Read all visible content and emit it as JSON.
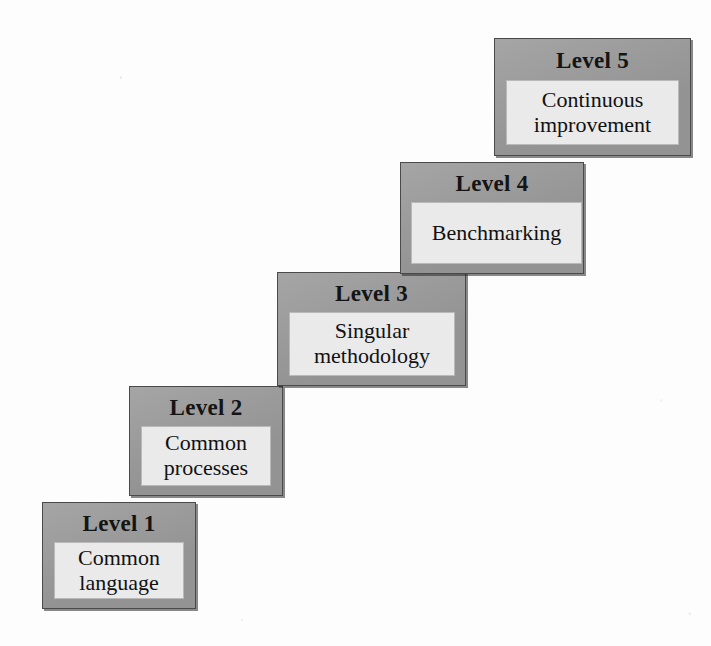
{
  "diagram": {
    "type": "staircase-maturity-model",
    "background_color": "#fdfdfd",
    "step_fill_color": "#9b9b9b",
    "step_inner_color": "#eaeaea",
    "step_border_color": "#4a4a4a",
    "text_color": "#111111",
    "steps": [
      {
        "header": "Level 1",
        "body": "Common\nlanguage"
      },
      {
        "header": "Level 2",
        "body": "Common\nprocesses"
      },
      {
        "header": "Level 3",
        "body": "Singular\nmethodology"
      },
      {
        "header": "Level 4",
        "body": "Benchmarking"
      },
      {
        "header": "Level 5",
        "body": "Continuous\nimprovement"
      }
    ]
  }
}
